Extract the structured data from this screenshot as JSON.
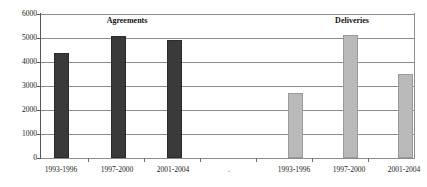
{
  "chart_data": {
    "type": "bar",
    "title": "",
    "xlabel": "",
    "ylabel": "",
    "ylim": [
      0,
      6000
    ],
    "grid": true,
    "legend_position": "none",
    "categories": [
      "1993-1996",
      "1997-2000",
      "2001-2004"
    ],
    "series": [
      {
        "name": "Agreements",
        "color": "#3a3a3a",
        "values": [
          4300,
          5000,
          4850
        ]
      },
      {
        "name": "Deliveries",
        "color": "#b9b9b9",
        "values": [
          2620,
          5030,
          3420
        ]
      }
    ],
    "y_ticks": [
      0,
      1000,
      2000,
      3000,
      4000,
      5000,
      6000
    ],
    "y_tick_labels": [
      "0",
      "1000",
      "2000",
      "3000",
      "4000",
      "5000",
      "6000"
    ],
    "panel_titles": [
      "Agreements",
      "Deliveries"
    ],
    "x_tick_labels": [
      "1993-1996",
      "1997-2000",
      "2001-2004",
      ".",
      "1993-1996",
      "1997-2000",
      "2001-2004"
    ]
  },
  "axis": {
    "y_labels": {
      "t0": "0",
      "t1": "1000",
      "t2": "2000",
      "t3": "3000",
      "t4": "4000",
      "t5": "5000",
      "t6": "6000"
    },
    "x_labels": {
      "a0": "1993-1996",
      "a1": "1997-2000",
      "a2": "2001-2004",
      "sep": ".",
      "d0": "1993-1996",
      "d1": "1997-2000",
      "d2": "2001-2004"
    }
  },
  "titles": {
    "agreements": "Agreements",
    "deliveries": "Deliveries"
  }
}
